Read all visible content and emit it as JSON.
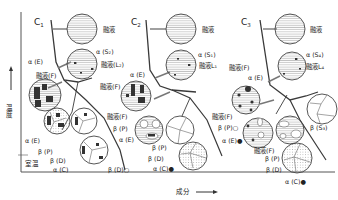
{
  "axes": {
    "y_label": "温度",
    "x_label": "成分",
    "room_temp": "室温"
  },
  "panels": [
    {
      "id": "C1",
      "title": "C",
      "title_sub": "1",
      "labels": {
        "melt_top": "融液",
        "alpha_s": "α (S₂)",
        "melt_l": "融液(L₂)",
        "alpha_e": "α (E)",
        "melt_f": "融液(F)",
        "melt_f2": "融液(F)",
        "alpha_e2": "α (E)",
        "beta_p": "β (P)",
        "beta_d": "β (D)",
        "alpha_c": "α (C)",
        "beta_d2": "β (D)○"
      }
    },
    {
      "id": "C2",
      "title": "C",
      "title_sub": "2",
      "labels": {
        "melt_top": "融液",
        "alpha_s": "α (S₁)",
        "melt_l": "融液L₁",
        "alpha_e": "α (E)",
        "melt_f": "融液(F)",
        "melt_f2": "融液(F)",
        "beta_p": "β (P)",
        "alpha_e2": "α (E)",
        "beta_p2": "β (P)",
        "beta_d": "β (D)",
        "alpha_c": "α (C)●"
      }
    },
    {
      "id": "C3",
      "title": "C",
      "title_sub": "3",
      "labels": {
        "melt_top": "融液",
        "alpha_s": "α (S₄)",
        "melt_l": "融液L₄",
        "melt_f": "融液(F)",
        "alpha_e": "α (E)",
        "melt_f2": "融液(F)",
        "beta_p": "β (P)○",
        "alpha_e2": "α (E)●",
        "melt_f3": "融液(F)",
        "beta_p2": "β (P)",
        "beta_d": "β (D)",
        "alpha_c": "α (C)●",
        "beta_s": "β (S₃)"
      }
    }
  ],
  "colors": {
    "line": "#3a3a3a",
    "hatch": "#bdbdbd",
    "phase_dark": "#3a3a3a",
    "dots": "#d9d9d9"
  }
}
